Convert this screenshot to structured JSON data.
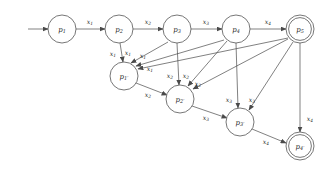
{
  "figure": {
    "background_color": "#ffffff",
    "stroke_color": "#4a4a4a",
    "text_color": "#2a2a2a"
  },
  "start_arrow": {
    "name": "start-arrow",
    "x1": 28,
    "y1": 29,
    "x2": 48,
    "y2": 29
  },
  "nodes": [
    {
      "id": "p1",
      "base": "p",
      "sub": "1",
      "cx": 62,
      "cy": 29,
      "r": 14,
      "accepting": false
    },
    {
      "id": "p2",
      "base": "p",
      "sub": "2",
      "cx": 119,
      "cy": 29,
      "r": 14,
      "accepting": false
    },
    {
      "id": "p3",
      "base": "p",
      "sub": "3",
      "cx": 177,
      "cy": 29,
      "r": 14,
      "accepting": false
    },
    {
      "id": "p4",
      "base": "p",
      "sub": "4",
      "cx": 236,
      "cy": 29,
      "r": 14,
      "accepting": false
    },
    {
      "id": "p5",
      "base": "p",
      "sub": "5",
      "cx": 300,
      "cy": 29,
      "r": 14,
      "accepting": true
    },
    {
      "id": "p1p",
      "base": "p",
      "sub": "1′",
      "cx": 124,
      "cy": 76,
      "r": 14,
      "accepting": false
    },
    {
      "id": "p2p",
      "base": "p",
      "sub": "2′",
      "cx": 180,
      "cy": 99,
      "r": 14,
      "accepting": false
    },
    {
      "id": "p3p",
      "base": "p",
      "sub": "3′",
      "cx": 240,
      "cy": 122,
      "r": 14,
      "accepting": false
    },
    {
      "id": "p4p",
      "base": "p",
      "sub": "4′",
      "cx": 300,
      "cy": 146,
      "r": 14,
      "accepting": true
    }
  ],
  "edges": [
    {
      "name": "edge-p1-p2",
      "from": "p1",
      "to": "p2",
      "sym": "x",
      "sub": "1",
      "x1": 76,
      "y1": 29,
      "x2": 105,
      "y2": 29,
      "lx": 90,
      "ly": 21
    },
    {
      "name": "edge-p2-p3",
      "from": "p2",
      "to": "p3",
      "sym": "x",
      "sub": "2",
      "x1": 133,
      "y1": 29,
      "x2": 163,
      "y2": 29,
      "lx": 148,
      "ly": 21
    },
    {
      "name": "edge-p3-p4",
      "from": "p3",
      "to": "p4",
      "sym": "x",
      "sub": "3",
      "x1": 191,
      "y1": 29,
      "x2": 222,
      "y2": 29,
      "lx": 206,
      "ly": 21
    },
    {
      "name": "edge-p4-p5",
      "from": "p4",
      "to": "p5",
      "sym": "x",
      "sub": "4",
      "x1": 250,
      "y1": 29,
      "x2": 286,
      "y2": 29,
      "lx": 268,
      "ly": 21
    },
    {
      "name": "edge-p2-p1prime",
      "from": "p2",
      "to": "p1p",
      "sym": "x",
      "sub": "1",
      "x1": 120,
      "y1": 43,
      "x2": 123,
      "y2": 62,
      "lx": 113,
      "ly": 53
    },
    {
      "name": "edge-p3-p1prime",
      "from": "p3",
      "to": "p1p",
      "sym": "x",
      "sub": "1",
      "x1": 168,
      "y1": 42,
      "x2": 131,
      "y2": 63,
      "lx": 128,
      "ly": 52
    },
    {
      "name": "edge-p4-p1prime",
      "from": "p4",
      "to": "p1p",
      "sym": "x",
      "sub": "1",
      "x1": 224,
      "y1": 40,
      "x2": 136,
      "y2": 66,
      "lx": 143,
      "ly": 55
    },
    {
      "name": "edge-p5-p1prime",
      "from": "p5",
      "to": "p1p",
      "sym": "x",
      "sub": "1",
      "x1": 288,
      "y1": 38,
      "x2": 138,
      "y2": 69,
      "lx": 150,
      "ly": 68
    },
    {
      "name": "edge-p3-p2prime",
      "from": "p3",
      "to": "p2p",
      "sym": "x",
      "sub": "2",
      "x1": 177,
      "y1": 43,
      "x2": 179,
      "y2": 85,
      "lx": 170,
      "ly": 75
    },
    {
      "name": "edge-p4-p2prime",
      "from": "p4",
      "to": "p2p",
      "sym": "x",
      "sub": "2",
      "x1": 227,
      "y1": 41,
      "x2": 188,
      "y2": 86,
      "lx": 186,
      "ly": 75
    },
    {
      "name": "edge-p5-p2prime",
      "from": "p5",
      "to": "p2p",
      "sym": "x",
      "sub": "2",
      "x1": 288,
      "y1": 39,
      "x2": 193,
      "y2": 89,
      "lx": 198,
      "ly": 83
    },
    {
      "name": "edge-p4-p3prime",
      "from": "p4",
      "to": "p3p",
      "sym": "x",
      "sub": "3",
      "x1": 236,
      "y1": 43,
      "x2": 238,
      "y2": 108,
      "lx": 229,
      "ly": 99
    },
    {
      "name": "edge-p5-p3prime",
      "from": "p5",
      "to": "p3p",
      "sym": "x",
      "sub": "3",
      "x1": 293,
      "y1": 42,
      "x2": 249,
      "y2": 110,
      "lx": 252,
      "ly": 99
    },
    {
      "name": "edge-p5-p4prime",
      "from": "p5",
      "to": "p4p",
      "sym": "x",
      "sub": "4",
      "x1": 300,
      "y1": 43,
      "x2": 300,
      "y2": 132,
      "lx": 310,
      "ly": 118
    },
    {
      "name": "edge-p1prime-p2prime",
      "from": "p1p",
      "to": "p2p",
      "sym": "x",
      "sub": "2",
      "x1": 136,
      "y1": 83,
      "x2": 167,
      "y2": 95,
      "lx": 148,
      "ly": 94
    },
    {
      "name": "edge-p2prime-p3prime",
      "from": "p2p",
      "to": "p3p",
      "sym": "x",
      "sub": "3",
      "x1": 192,
      "y1": 106,
      "x2": 227,
      "y2": 118,
      "lx": 206,
      "ly": 117
    },
    {
      "name": "edge-p3prime-p4prime",
      "from": "p3p",
      "to": "p4p",
      "sym": "x",
      "sub": "4",
      "x1": 252,
      "y1": 129,
      "x2": 286,
      "y2": 143,
      "lx": 266,
      "ly": 141
    }
  ]
}
